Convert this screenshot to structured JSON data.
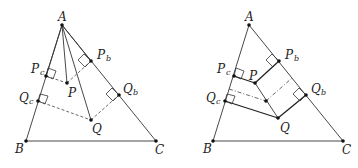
{
  "figures": [
    {
      "id": "left",
      "labels": {
        "A": "A",
        "B": "B",
        "C": "C",
        "P": "P",
        "Q": "Q",
        "Pc": "P",
        "Pc_sub": "c",
        "Pb": "P",
        "Pb_sub": "b",
        "Qc": "Q",
        "Qc_sub": "c",
        "Qb": "Q",
        "Qb_sub": "b"
      }
    },
    {
      "id": "right",
      "labels": {
        "A": "A",
        "B": "B",
        "C": "C",
        "P": "P",
        "Q": "Q",
        "Pc": "P",
        "Pc_sub": "c",
        "Pb": "P",
        "Pb_sub": "b",
        "Qc": "Q",
        "Qc_sub": "c",
        "Qb": "Q",
        "Qb_sub": "b"
      }
    }
  ],
  "colors": {
    "stroke": "#333333",
    "background": "#ffffff"
  }
}
